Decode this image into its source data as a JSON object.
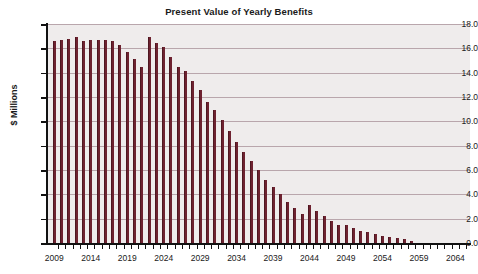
{
  "chart_data": {
    "type": "bar",
    "title": "Present Value of Yearly Benefits",
    "subtitle": "",
    "xlabel": "",
    "ylabel": "$ Millions",
    "ylim": [
      0.0,
      18.0
    ],
    "ytick_step": 2.0,
    "ytick_labels": [
      "18.0",
      "16.0",
      "14.0",
      "12.0",
      "10.0",
      "8.0",
      "6.0",
      "4.0",
      "2.0",
      "0.0"
    ],
    "ytick_values": [
      18.0,
      16.0,
      14.0,
      12.0,
      10.0,
      8.0,
      6.0,
      4.0,
      2.0,
      0.0
    ],
    "xlim": [
      2008,
      2066
    ],
    "xtick_labels": [
      "2009",
      "2014",
      "2019",
      "2024",
      "2029",
      "2034",
      "2039",
      "2044",
      "2049",
      "2054",
      "2059",
      "2064"
    ],
    "xtick_values": [
      2009,
      2014,
      2019,
      2024,
      2029,
      2034,
      2039,
      2044,
      2049,
      2054,
      2059,
      2064
    ],
    "minor_xticks_every": 1,
    "grid": "horizontal",
    "legend": "none",
    "bar_color": "#6e2230",
    "plot_background": "#efecec",
    "gridline_color": "#b9a6ac",
    "categories": [
      2009,
      2010,
      2011,
      2012,
      2013,
      2014,
      2015,
      2016,
      2017,
      2018,
      2019,
      2020,
      2021,
      2022,
      2023,
      2024,
      2025,
      2026,
      2027,
      2028,
      2029,
      2030,
      2031,
      2032,
      2033,
      2034,
      2035,
      2036,
      2037,
      2038,
      2039,
      2040,
      2041,
      2042,
      2043,
      2044,
      2045,
      2046,
      2047,
      2048,
      2049,
      2050,
      2051,
      2052,
      2053,
      2054,
      2055,
      2056,
      2057,
      2058,
      2059,
      2060,
      2061,
      2062,
      2063,
      2064,
      2065
    ],
    "values": [
      16.6,
      16.7,
      16.8,
      16.9,
      16.6,
      16.7,
      16.7,
      16.7,
      16.6,
      16.3,
      15.7,
      15.1,
      14.5,
      16.9,
      16.4,
      16.1,
      15.3,
      14.5,
      14.1,
      13.3,
      12.6,
      11.6,
      10.9,
      10.1,
      9.2,
      8.3,
      7.5,
      6.7,
      6.0,
      5.2,
      4.6,
      4.0,
      3.4,
      2.9,
      2.4,
      3.1,
      2.6,
      2.2,
      1.8,
      1.5,
      1.5,
      1.2,
      1.0,
      0.9,
      0.7,
      0.6,
      0.5,
      0.4,
      0.3,
      0.2,
      0.0,
      0.0,
      0.0,
      0.0,
      0.0,
      0.0,
      0.0
    ]
  }
}
